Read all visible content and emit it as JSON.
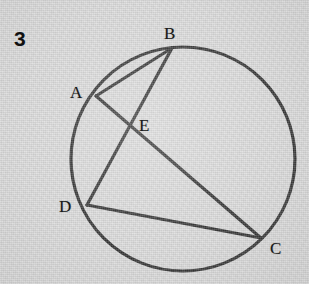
{
  "figure": {
    "problem_number": "3",
    "background_color": "#d6d6d6",
    "ink_color": "#141414",
    "circle": {
      "cx": 183,
      "cy": 159,
      "r": 112,
      "stroke_width": 3.2
    },
    "points": [
      {
        "id": "A",
        "label": "A",
        "x": 96,
        "y": 96,
        "label_x": 70,
        "label_y": 84
      },
      {
        "id": "B",
        "label": "B",
        "x": 172,
        "y": 48,
        "label_x": 164,
        "label_y": 25
      },
      {
        "id": "C",
        "label": "C",
        "x": 261,
        "y": 238,
        "label_x": 270,
        "label_y": 240
      },
      {
        "id": "D",
        "label": "D",
        "x": 87,
        "y": 205,
        "label_x": 59,
        "label_y": 198
      },
      {
        "id": "E",
        "label": "E",
        "x": 130,
        "y": 130,
        "label_x": 139,
        "label_y": 117
      }
    ],
    "segments": [
      {
        "id": "AB",
        "from": "A",
        "to": "B",
        "x1": 96,
        "y1": 96,
        "x2": 172,
        "y2": 48
      },
      {
        "id": "BD",
        "from": "B",
        "to": "D",
        "x1": 172,
        "y1": 48,
        "x2": 87,
        "y2": 205
      },
      {
        "id": "AC",
        "from": "A",
        "to": "C",
        "x1": 96,
        "y1": 96,
        "x2": 261,
        "y2": 238
      },
      {
        "id": "DC",
        "from": "D",
        "to": "C",
        "x1": 87,
        "y1": 205,
        "x2": 261,
        "y2": 238
      }
    ]
  }
}
